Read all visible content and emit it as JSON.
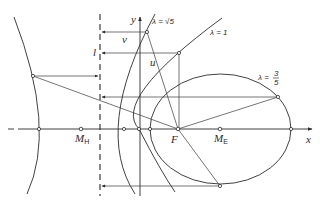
{
  "diagram": {
    "labels": {
      "x_axis": "x",
      "y_axis": "y",
      "directrix": "l",
      "focus": "F",
      "center_hyperbola": "M",
      "center_hyperbola_sub": "H",
      "center_ellipse": "M",
      "center_ellipse_sub": "E",
      "distance_v": "v",
      "distance_u": "u",
      "hyperbola_param": "λ = √5",
      "parabola_param": "λ = 1",
      "ellipse_param_prefix": "λ =",
      "ellipse_param_num": "3",
      "ellipse_param_den": "5"
    },
    "curves": [
      {
        "name": "hyperbola",
        "eccentricity": "√5"
      },
      {
        "name": "parabola",
        "eccentricity": "1"
      },
      {
        "name": "ellipse",
        "eccentricity": "3/5"
      }
    ],
    "colors": {
      "ink": "#2b2b2b",
      "background": "#ffffff"
    }
  }
}
